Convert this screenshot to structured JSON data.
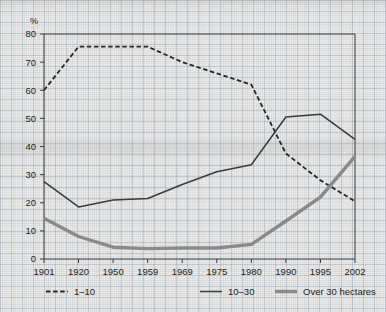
{
  "axis": {
    "y_unit": "%",
    "y_ticks": [
      "0",
      "10",
      "20",
      "30",
      "40",
      "50",
      "60",
      "70",
      "80"
    ],
    "x_ticks": [
      "1901",
      "1920",
      "1950",
      "1959",
      "1969",
      "1975",
      "1980",
      "1990",
      "1995",
      "2002"
    ]
  },
  "legend": {
    "items": [
      {
        "label": "1–10",
        "marker": "dashed-line-swatch",
        "color": "#262626"
      },
      {
        "label": "10–30",
        "marker": "solid-thin-line-swatch",
        "color": "#3a3a3a"
      },
      {
        "label": "Over 30 hectares",
        "marker": "solid-thick-line-swatch",
        "color": "#8a8a8a"
      }
    ]
  },
  "chart_data": {
    "type": "line",
    "title": "",
    "xlabel": "",
    "ylabel": "%",
    "ylim": [
      0,
      80
    ],
    "ytick_step": 10,
    "grid": true,
    "legend_position": "bottom",
    "categories": [
      "1901",
      "1920",
      "1950",
      "1959",
      "1969",
      "1975",
      "1980",
      "1990",
      "1995",
      "2002"
    ],
    "series": [
      {
        "name": "1–10",
        "style": "dashed",
        "color": "#262626",
        "width": 1.8,
        "values": [
          60,
          75.5,
          75.5,
          75.5,
          70,
          66,
          62,
          37.5,
          28,
          20.5
        ]
      },
      {
        "name": "10–30",
        "style": "solid",
        "color": "#3a3a3a",
        "width": 1.5,
        "values": [
          27.5,
          18.5,
          21,
          21.5,
          26.5,
          31,
          33.5,
          50.5,
          51.5,
          42.5
        ]
      },
      {
        "name": "Over 30 hectares",
        "style": "solid",
        "color": "#8a8a8a",
        "width": 3.4,
        "values": [
          14.5,
          8,
          4.2,
          3.7,
          3.9,
          3.9,
          5.2,
          13.5,
          22,
          36.5
        ]
      }
    ]
  }
}
